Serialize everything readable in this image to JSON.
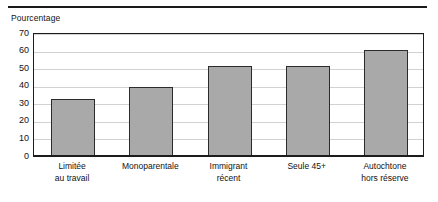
{
  "figure": {
    "ylabel_text": "Pourcentage"
  },
  "chart_data": {
    "type": "bar",
    "title": "",
    "subtitle": "",
    "xlabel": "",
    "ylabel": "Pourcentage",
    "ylim": [
      0,
      70
    ],
    "ytick_values": [
      70,
      60,
      50,
      40,
      30,
      20,
      10,
      0
    ],
    "ytick_labels": [
      "70",
      "60",
      "50",
      "40",
      "30",
      "20",
      "10",
      "0"
    ],
    "grid": true,
    "legend": false,
    "bar_color": "#a9a9a9",
    "bar_edge_color": "#2b2b2b",
    "categories": [
      "Limitée au travail",
      "Monoparentale",
      "Immigrant récent",
      "Seule 45+",
      "Autochtone hors réserve"
    ],
    "category_lines": [
      [
        "Limitée",
        "au travail"
      ],
      [
        "Monoparentale",
        ""
      ],
      [
        "Immigrant",
        "récent"
      ],
      [
        "Seule 45+",
        ""
      ],
      [
        "Autochtone",
        "hors réserve"
      ]
    ],
    "values": [
      33,
      40,
      52,
      52,
      61
    ]
  }
}
